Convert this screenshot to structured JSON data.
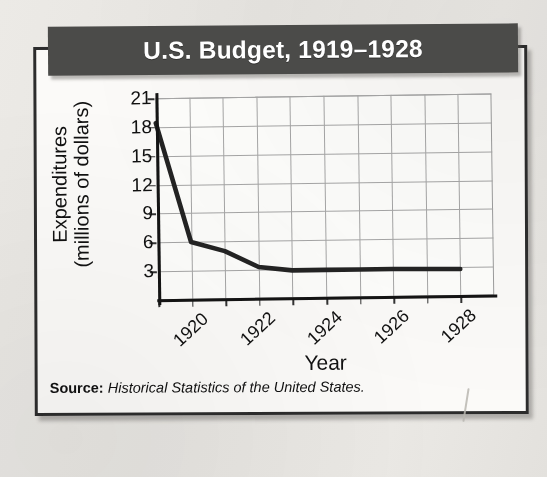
{
  "figure": {
    "title": "U.S. Budget, 1919–1928",
    "source_label": "Source:",
    "source_text": "Historical Statistics of the United States.",
    "colors": {
      "banner": "#4b4b49",
      "banner_text": "#ffffff",
      "card": "#fbfaf8",
      "card_border": "#2c2c2c",
      "page_background": "#e8e7e4",
      "line": "#232323",
      "gridline": "#a6a6a6",
      "axis": "#141414"
    }
  },
  "chart_data": {
    "type": "line",
    "title": "U.S. Budget, 1919–1928",
    "xlabel": "Year",
    "ylabel_line1": "Expenditures",
    "ylabel_line2": "(millions of dollars)",
    "ylabel": "Expenditures (millions of dollars)",
    "x": [
      1919,
      1920,
      1921,
      1922,
      1923,
      1924,
      1925,
      1926,
      1927,
      1928
    ],
    "values": [
      18.4,
      6.0,
      5.0,
      3.3,
      2.9,
      2.9,
      2.9,
      2.9,
      2.85,
      2.8
    ],
    "series": [
      {
        "name": "Expenditures",
        "values": [
          18.4,
          6.0,
          5.0,
          3.3,
          2.9,
          2.9,
          2.9,
          2.9,
          2.85,
          2.8
        ]
      }
    ],
    "yticks": [
      3,
      6,
      9,
      12,
      15,
      18,
      21
    ],
    "ytick_labels": [
      "3",
      "6",
      "9",
      "12",
      "15",
      "18",
      "21"
    ],
    "ylim": [
      0,
      21
    ],
    "xlim": [
      1919,
      1928
    ],
    "xticks": [
      1919,
      1920,
      1921,
      1922,
      1923,
      1924,
      1925,
      1926,
      1927,
      1928
    ],
    "xtick_labels": [
      "",
      "1920",
      "",
      "1922",
      "",
      "1924",
      "",
      "1926",
      "",
      "1928"
    ],
    "grid": true,
    "legend": "none"
  }
}
